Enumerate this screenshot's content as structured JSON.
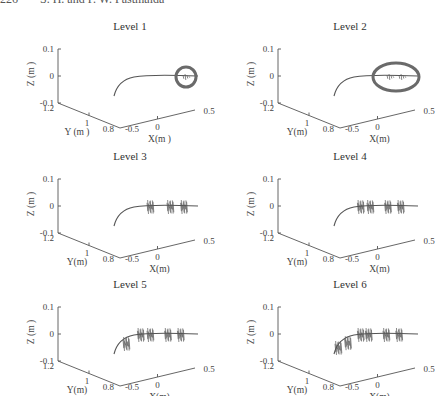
{
  "header": {
    "page_number": "226",
    "authors": "S. H. and P. W. Fastmaida"
  },
  "chart_data": [
    {
      "type": "scatter",
      "title": "Level 1",
      "xlabel": "X(m )",
      "ylabel": "Y (m )",
      "zlabel": "Z (m )",
      "xticks": [
        "-0.5",
        "0",
        "0.5"
      ],
      "yticks": [
        "1.2",
        "1",
        "0.8"
      ],
      "zticks": [
        "0.1",
        "0",
        "-0.1"
      ],
      "xlim": [
        -0.5,
        0.5
      ],
      "ylim": [
        0.8,
        1.2
      ],
      "zlim": [
        -0.1,
        0.1
      ],
      "trajectory": "curved path from x≈-0.5 sweeping to x≈0.5 at z≈0",
      "disturbance_x": [
        0.35
      ],
      "highlight": "circle around disturbance"
    },
    {
      "type": "scatter",
      "title": "Level 2",
      "xlabel": "X(m)",
      "ylabel": "Y(m)",
      "zlabel": "Z (m )",
      "xticks": [
        "-0.5",
        "0",
        "0.5"
      ],
      "yticks": [
        "1.2",
        "1",
        "0.8"
      ],
      "zticks": [
        "0.1",
        "0",
        "-0.1"
      ],
      "xlim": [
        -0.5,
        0.5
      ],
      "ylim": [
        0.8,
        1.2
      ],
      "zlim": [
        -0.1,
        0.1
      ],
      "disturbance_x": [
        0.15,
        0.3
      ],
      "highlight": "ellipse around disturbances"
    },
    {
      "type": "scatter",
      "title": "Level 3",
      "xlabel": "X(m)",
      "ylabel": "Y(m)",
      "zlabel": "Z (m )",
      "xticks": [
        "-0.5",
        "0",
        "0.5"
      ],
      "yticks": [
        "1.2",
        "1",
        "0.8"
      ],
      "zticks": [
        "0.1",
        "0",
        "-0.1"
      ],
      "xlim": [
        -0.5,
        0.5
      ],
      "ylim": [
        0.8,
        1.2
      ],
      "zlim": [
        -0.1,
        0.1
      ],
      "disturbance_x": [
        -0.1,
        0.15,
        0.32
      ]
    },
    {
      "type": "scatter",
      "title": "Level 4",
      "xlabel": "X(m)",
      "ylabel": "Y(m)",
      "zlabel": "Z (m )",
      "xticks": [
        "-0.5",
        "0",
        "0.5"
      ],
      "yticks": [
        "1.2",
        "1",
        "0.8"
      ],
      "zticks": [
        "0.1",
        "0",
        "-0.1"
      ],
      "xlim": [
        -0.5,
        0.5
      ],
      "ylim": [
        0.8,
        1.2
      ],
      "zlim": [
        -0.1,
        0.1
      ],
      "disturbance_x": [
        -0.22,
        -0.1,
        0.12,
        0.28
      ]
    },
    {
      "type": "scatter",
      "title": "Level 5",
      "xlabel": "X(m)",
      "ylabel": "Y(m)",
      "zlabel": "Z (m )",
      "xticks": [
        "-0.5",
        "0",
        "0.5"
      ],
      "yticks": [
        "1.2",
        "1",
        "0.8"
      ],
      "zticks": [
        "0.1",
        "0",
        "-0.1"
      ],
      "xlim": [
        -0.5,
        0.5
      ],
      "ylim": [
        0.8,
        1.2
      ],
      "zlim": [
        -0.1,
        0.1
      ],
      "disturbance_x": [
        -0.4,
        -0.22,
        -0.1,
        0.12,
        0.28
      ]
    },
    {
      "type": "scatter",
      "title": "Level 6",
      "xlabel": "X(m)",
      "ylabel": "Y(m)",
      "zlabel": "Z (m )",
      "xticks": [
        "-0.5",
        "0",
        "0.5"
      ],
      "yticks": [
        "1.2",
        "1",
        "0.8"
      ],
      "zticks": [
        "0.1",
        "0",
        "-0.1"
      ],
      "xlim": [
        -0.5,
        0.5
      ],
      "ylim": [
        0.8,
        1.2
      ],
      "zlim": [
        -0.1,
        0.1
      ],
      "disturbance_x": [
        -0.5,
        -0.38,
        -0.22,
        -0.12,
        0.1,
        0.26
      ]
    }
  ]
}
